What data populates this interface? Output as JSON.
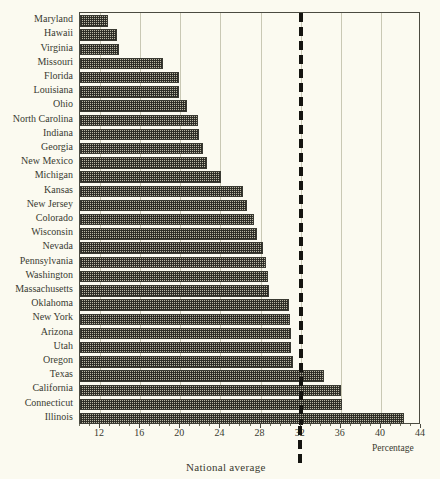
{
  "chart_data": {
    "type": "bar",
    "orientation": "horizontal",
    "title": "",
    "xlabel": "Percentage",
    "ylabel": "",
    "xlim": [
      10,
      44
    ],
    "xticks": [
      12,
      16,
      20,
      24,
      28,
      32,
      36,
      40,
      44
    ],
    "grid": true,
    "legend": null,
    "annotations": [
      {
        "name": "national-average",
        "label": "National average",
        "value": 32,
        "style": "dashed vertical line"
      }
    ],
    "categories": [
      "Maryland",
      "Hawaii",
      "Virginia",
      "Missouri",
      "Florida",
      "Louisiana",
      "Ohio",
      "North Carolina",
      "Indiana",
      "Georgia",
      "New Mexico",
      "Michigan",
      "Kansas",
      "New Jersey",
      "Colorado",
      "Wisconsin",
      "Nevada",
      "Pennsylvania",
      "Washington",
      "Massachusetts",
      "Oklahoma",
      "New York",
      "Arizona",
      "Utah",
      "Oregon",
      "Texas",
      "California",
      "Connecticut",
      "Illinois"
    ],
    "values": [
      12.8,
      13.7,
      13.9,
      18.3,
      19.9,
      19.9,
      20.7,
      21.8,
      21.9,
      22.3,
      22.7,
      24.1,
      26.3,
      26.7,
      27.3,
      27.6,
      28.2,
      28.5,
      28.7,
      28.8,
      30.8,
      30.9,
      31.0,
      31.0,
      31.2,
      34.3,
      36.0,
      36.1,
      42.3
    ]
  },
  "axis": {
    "x_title": "Percentage",
    "average_caption": "National average"
  }
}
